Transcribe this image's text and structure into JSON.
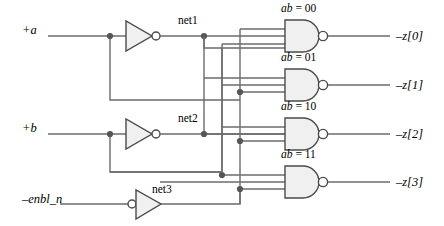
{
  "diagram": {
    "stroke_color": "#4d4d4d",
    "dark_stroke_color": "#1a1a1a",
    "gate_fill": "#f2f2f2",
    "background": "#ffffff",
    "inputs": [
      {
        "id": "a",
        "label": "+a",
        "x": 22,
        "y": 30
      },
      {
        "id": "b",
        "label": "+b",
        "x": 22,
        "y": 128
      },
      {
        "id": "enbl_n",
        "label": "–enbl_n",
        "x": 22,
        "y": 199
      }
    ],
    "nets": [
      {
        "id": "net1",
        "label": "net1",
        "x": 178,
        "y": 21
      },
      {
        "id": "net2",
        "label": "net2",
        "x": 178,
        "y": 119
      },
      {
        "id": "net3",
        "label": "net3",
        "x": 152,
        "y": 190
      }
    ],
    "gates": [
      {
        "id": "g0",
        "label_prefix": "ab",
        "label_eq": "=",
        "label_value": "00",
        "label_x": 281,
        "label_y": 9,
        "y": 36
      },
      {
        "id": "g1",
        "label_prefix": "ab",
        "label_eq": "=",
        "label_value": "01",
        "label_x": 281,
        "label_y": 58,
        "y": 85
      },
      {
        "id": "g2",
        "label_prefix": "ab",
        "label_eq": "=",
        "label_value": "10",
        "label_x": 281,
        "label_y": 107,
        "y": 134
      },
      {
        "id": "g3",
        "label_prefix": "ab",
        "label_eq": "=",
        "label_value": "11",
        "label_x": 281,
        "label_y": 155,
        "y": 182
      }
    ],
    "outputs": [
      {
        "id": "z0",
        "label": "–z[0]",
        "x": 396,
        "y": 30
      },
      {
        "id": "z1",
        "label": "–z[1]",
        "x": 396,
        "y": 79
      },
      {
        "id": "z2",
        "label": "–z[2]",
        "x": 396,
        "y": 128
      },
      {
        "id": "z3",
        "label": "–z[3]",
        "x": 396,
        "y": 176
      }
    ]
  }
}
